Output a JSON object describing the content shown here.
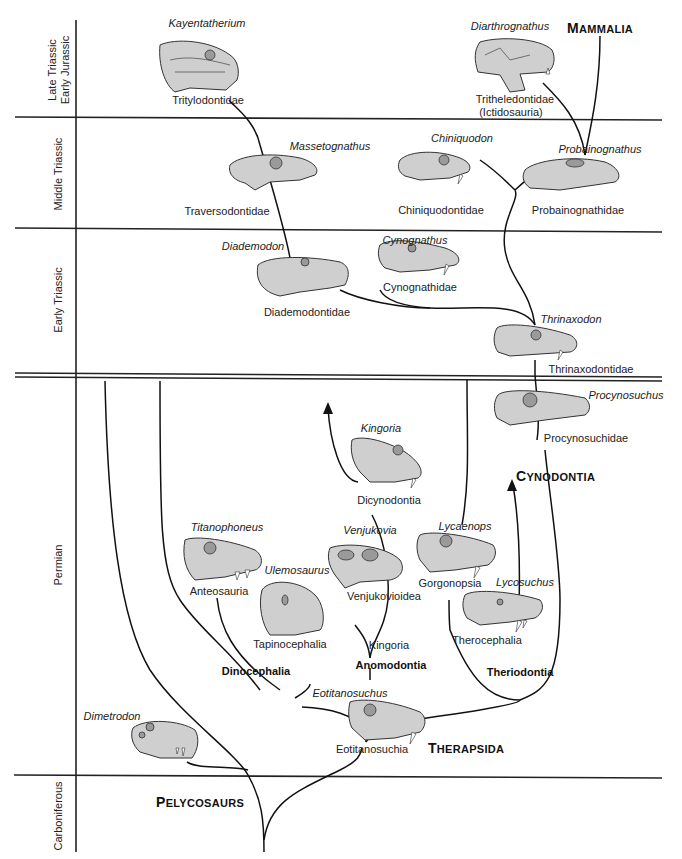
{
  "periods": [
    {
      "id": "late-triassic-early-jurassic",
      "lines": [
        "Late Triassic",
        "Early Jurassic"
      ]
    },
    {
      "id": "middle-triassic",
      "lines": [
        "Middle Triassic"
      ]
    },
    {
      "id": "early-triassic",
      "lines": [
        "Early Triassic"
      ]
    },
    {
      "id": "permian",
      "lines": [
        "Permian"
      ]
    },
    {
      "id": "carboniferous",
      "lines": [
        "Carboniferous"
      ]
    }
  ],
  "major_groups": {
    "mammalia": {
      "first": "M",
      "rest": "AMMALIA"
    },
    "cynodontia": {
      "first": "C",
      "rest": "YNODONTIA"
    },
    "therapsida": {
      "first": "T",
      "rest": "HERAPSIDA"
    },
    "pelycosaurs": {
      "first": "P",
      "rest": "ELYCOSAURS"
    }
  },
  "groups": {
    "dinocephalia": "Dinocephalia",
    "anomodontia": "Anomodontia",
    "theriodontia": "Theriodontia"
  },
  "taxa": [
    {
      "id": "kayentatherium",
      "genus": "Kayentatherium",
      "family": "Tritylodontidae"
    },
    {
      "id": "diarthrognathus",
      "genus": "Diarthrognathus",
      "family": "Tritheledontidae",
      "family2": "(Ictidosauria)"
    },
    {
      "id": "massetognathus",
      "genus": "Massetognathus",
      "family": "Traversodontidae"
    },
    {
      "id": "chiniquodon",
      "genus": "Chiniquodon",
      "family": "Chiniquodontidae"
    },
    {
      "id": "probainognathus",
      "genus": "Probainognathus",
      "family": "Probainognathidae"
    },
    {
      "id": "diademodon",
      "genus": "Diademodon",
      "family": "Diademodontidae"
    },
    {
      "id": "cynognathus",
      "genus": "Cynognathus",
      "family": "Cynognathidae"
    },
    {
      "id": "thrinaxodon",
      "genus": "Thrinaxodon",
      "family": "Thrinaxodontidae"
    },
    {
      "id": "procynosuchus",
      "genus": "Procynosuchus",
      "family": "Procynosuchidae"
    },
    {
      "id": "kingoria",
      "genus": "Kingoria",
      "family": "Dicynodontia"
    },
    {
      "id": "titanophoneus",
      "genus": "Titanophoneus",
      "family": "Anteosauria"
    },
    {
      "id": "ulemosaurus",
      "genus": "Ulemosaurus",
      "family": "Tapinocephalia"
    },
    {
      "id": "venjukovia",
      "genus": "Venjukovia",
      "family": "Venjukovioidea"
    },
    {
      "id": "lycaenops",
      "genus": "Lycaenops",
      "family": "Gorgonopsia"
    },
    {
      "id": "lycosuchus",
      "genus": "Lycosuchus",
      "family": "Therocephalia"
    },
    {
      "id": "eotitanosuchus",
      "genus": "Eotitanosuchus",
      "family": "Eotitanosuchia"
    },
    {
      "id": "dimetrodon",
      "genus": "Dimetrodon",
      "family": ""
    }
  ],
  "node_labels": {
    "kingoria_node": "Kingoria"
  }
}
